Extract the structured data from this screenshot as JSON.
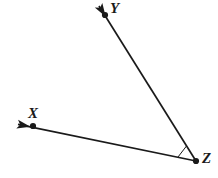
{
  "figure": {
    "kind": "geometry-diagram",
    "background_color": "#ffffff",
    "stroke_color": "#1a1a1a",
    "canvas": {
      "width": 218,
      "height": 178
    }
  },
  "labels": {
    "y": "Y",
    "x": "X",
    "z": "Z"
  },
  "points": [
    {
      "name": "Y",
      "label": "Y",
      "x": 105,
      "y": 15,
      "dot": true
    },
    {
      "name": "X",
      "label": "X",
      "x": 33,
      "y": 126,
      "dot": true
    },
    {
      "name": "Z",
      "label": "Z",
      "x": 196,
      "y": 161,
      "dot": true
    }
  ],
  "rays": [
    {
      "name": "ray-ZY",
      "from": {
        "x": 196,
        "y": 161
      },
      "through": {
        "x": 105,
        "y": 15
      },
      "to": {
        "x": 97,
        "y": 4
      },
      "arrowhead": "at-end"
    },
    {
      "name": "ray-ZX",
      "from": {
        "x": 196,
        "y": 161
      },
      "through": {
        "x": 33,
        "y": 126
      },
      "to": {
        "x": 15,
        "y": 124
      },
      "arrowhead": "at-end"
    }
  ],
  "angle_marker": {
    "name": "angle-marker-Z",
    "vertex": {
      "x": 196,
      "y": 161
    },
    "p1": {
      "x": 178,
      "y": 157
    },
    "p2": {
      "x": 186,
      "y": 146
    }
  }
}
